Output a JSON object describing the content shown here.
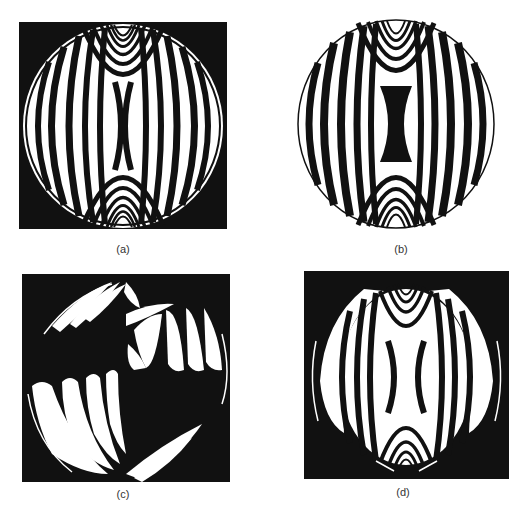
{
  "figure": {
    "panels": [
      {
        "id": "a",
        "label": "(a)",
        "background": "#111111",
        "description": "Closed fringe pattern on black square: vertical curved fringes, concentric loops at top and bottom, white center gap"
      },
      {
        "id": "b",
        "label": "(b)",
        "background": "#ffffff",
        "description": "Fringe pattern on white background with black hourglass shape in the center"
      },
      {
        "id": "c",
        "label": "(c)",
        "background": "#111111",
        "description": "Fragmented feather-like white fringes in four quadrants on black square"
      },
      {
        "id": "d",
        "label": "(d)",
        "background": "#111111",
        "description": "Fringe pattern on black square with wide white outer lobes and concentric loops top and bottom"
      }
    ],
    "colors": {
      "ink": "#111111",
      "paper": "#ffffff"
    }
  }
}
